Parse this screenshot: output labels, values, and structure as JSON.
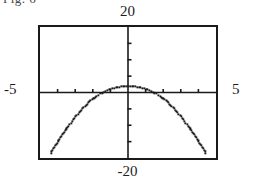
{
  "figure": {
    "caption_fragment": "Fig. 6",
    "background_color": "#ffffff",
    "ink_color": "#1a1a1a"
  },
  "calculator_screen": {
    "frame_color": "#1a1a1a",
    "axis_color": "#1a1a1a",
    "curve_color": "#1a1a1a",
    "window_labels": {
      "ymax": "20",
      "ymin": "-20",
      "xmin": "-5",
      "xmax": "5"
    }
  },
  "chart_data": {
    "type": "line",
    "title": "",
    "xlabel": "",
    "ylabel": "",
    "xlim": [
      -5,
      5
    ],
    "ylim": [
      -20,
      20
    ],
    "grid": false,
    "legend": null,
    "axes": {
      "x_axis_at_y": 0,
      "y_axis_at_x": 0,
      "xscl": 1,
      "yscl": 5,
      "x_tick_values": [
        -4,
        -3,
        -2,
        -1,
        1,
        2,
        3,
        4
      ],
      "y_tick_values": [
        -15,
        -10,
        -5,
        5,
        10,
        15
      ]
    },
    "series": [
      {
        "name": "y",
        "x": [
          -4.4,
          -4.2,
          -4.0,
          -3.8,
          -3.6,
          -3.4,
          -3.2,
          -3.0,
          -2.8,
          -2.6,
          -2.4,
          -2.2,
          -2.0,
          -1.8,
          -1.6,
          -1.4,
          -1.2,
          -1.0,
          -0.8,
          -0.6,
          -0.4,
          -0.2,
          0.0,
          0.2,
          0.4,
          0.6,
          0.8,
          1.0,
          1.2,
          1.4,
          1.6,
          1.8,
          2.0,
          2.2,
          2.4,
          2.6,
          2.8,
          3.0,
          3.2,
          3.4,
          3.6,
          3.8,
          4.0,
          4.2,
          4.4
        ],
        "y": [
          -18.4,
          -16.6,
          -14.9,
          -13.2,
          -11.6,
          -10.1,
          -8.7,
          -7.3,
          -6.0,
          -4.8,
          -3.7,
          -2.7,
          -1.8,
          -1.0,
          -0.3,
          0.3,
          0.8,
          1.2,
          1.5,
          1.7,
          1.85,
          1.95,
          2.0,
          1.95,
          1.85,
          1.7,
          1.5,
          1.2,
          0.8,
          0.3,
          -0.3,
          -1.0,
          -1.8,
          -2.7,
          -3.7,
          -4.8,
          -6.0,
          -7.3,
          -8.7,
          -10.1,
          -11.6,
          -13.2,
          -14.9,
          -16.6,
          -18.4
        ],
        "style": "dotted-pixelated",
        "shape": "downward-parabola",
        "vertex": [
          0,
          2.0
        ]
      }
    ]
  }
}
